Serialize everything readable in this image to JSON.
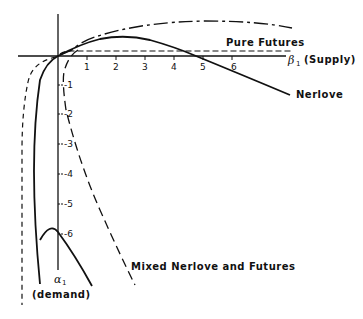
{
  "diagram": {
    "x_axis": {
      "symbol": "β",
      "subscript": "1",
      "label": "(Supply)",
      "ticks": [
        "1",
        "2",
        "3",
        "4",
        "5",
        "6"
      ]
    },
    "y_axis": {
      "symbol": "α",
      "subscript": "1",
      "label": "(demand)",
      "ticks": [
        "-1",
        "-2",
        "-3",
        "-4",
        "-5",
        "-6"
      ]
    },
    "curves": [
      {
        "name": "Pure Futures",
        "style": "dashed"
      },
      {
        "name": "Nerlove",
        "style": "solid"
      },
      {
        "name": "Mixed Nerlove and Futures",
        "style": "long-dash"
      },
      {
        "name": "upper envelope",
        "style": "dash-dot"
      },
      {
        "name": "left boundary",
        "style": "short-dash"
      }
    ],
    "labels": {
      "pure_futures": "Pure Futures",
      "nerlove": "Nerlove",
      "mixed": "Mixed Nerlove and Futures"
    }
  }
}
